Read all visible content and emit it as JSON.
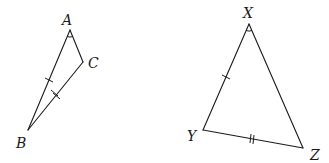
{
  "figure": {
    "triangles": [
      {
        "name": "ABC",
        "vertices": [
          {
            "label": "A",
            "x": 70,
            "y": 30,
            "lx": 62,
            "ly": 25
          },
          {
            "label": "B",
            "x": 28,
            "y": 130,
            "lx": 16,
            "ly": 148
          },
          {
            "label": "C",
            "x": 83,
            "y": 62,
            "lx": 88,
            "ly": 68
          }
        ],
        "angle_mark_at": "A",
        "single_tick_side": "AB",
        "double_tick_side": "BC"
      },
      {
        "name": "XYZ",
        "vertices": [
          {
            "label": "X",
            "x": 249,
            "y": 24,
            "lx": 243,
            "ly": 18
          },
          {
            "label": "Y",
            "x": 203,
            "y": 130,
            "lx": 187,
            "ly": 141
          },
          {
            "label": "Z",
            "x": 303,
            "y": 148,
            "lx": 310,
            "ly": 160
          }
        ],
        "angle_mark_at": "X",
        "single_tick_side": "XY",
        "double_tick_side": "YZ"
      }
    ]
  }
}
